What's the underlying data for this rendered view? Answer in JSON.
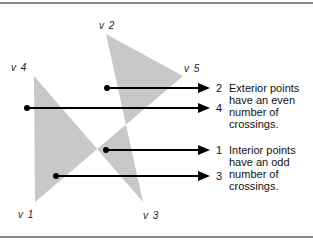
{
  "figure": {
    "vertices": [
      {
        "id": "v1",
        "label": "v 1",
        "x": 35,
        "y": 202
      },
      {
        "id": "v2",
        "label": "v 2",
        "x": 106,
        "y": 34
      },
      {
        "id": "v3",
        "label": "v 3",
        "x": 143,
        "y": 202
      },
      {
        "id": "v4",
        "label": "v 4",
        "x": 34,
        "y": 76
      },
      {
        "id": "v5",
        "label": "v 5",
        "x": 183,
        "y": 76
      }
    ],
    "rays": [
      {
        "crossings": "2",
        "start_x": 107,
        "y": 88,
        "type": "exterior"
      },
      {
        "crossings": "4",
        "start_x": 27,
        "y": 108,
        "type": "exterior"
      },
      {
        "crossings": "1",
        "start_x": 106,
        "y": 150,
        "type": "interior"
      },
      {
        "crossings": "3",
        "start_x": 56,
        "y": 176,
        "type": "interior"
      }
    ],
    "notes": {
      "exterior": "Exterior points have an even number of crossings.",
      "interior": "Interior points have an odd number of crossings."
    },
    "colors": {
      "fill": "#c8c8c8",
      "line": "#000000",
      "rule": "#8a8a8a"
    }
  }
}
